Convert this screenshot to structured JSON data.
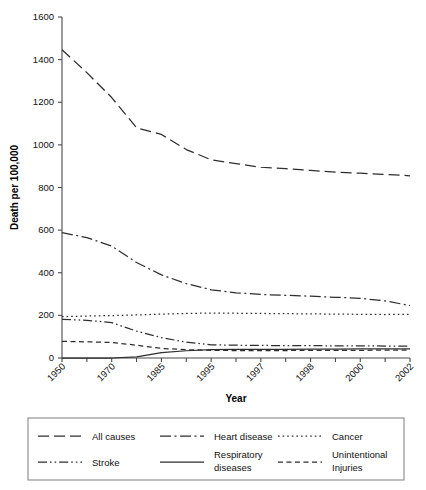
{
  "chart_data": {
    "type": "line",
    "title": "",
    "xlabel": "Year",
    "ylabel": "Death per 100,000",
    "ylim": [
      0,
      1600
    ],
    "ytick_values": [
      0,
      200,
      400,
      600,
      800,
      1000,
      1200,
      1400,
      1600
    ],
    "ytick_labels": [
      "0",
      "200",
      "400",
      "600",
      "800",
      "1000",
      "1200",
      "1400",
      "1600"
    ],
    "grid": false,
    "legend_position": "below-axes",
    "x_index_count": 15,
    "x_labeled_indices": [
      0,
      2,
      4,
      6,
      8,
      10,
      12,
      14
    ],
    "categories": [
      "1950",
      "1960",
      "1970",
      "1980",
      "1985",
      "1990",
      "1995",
      "1996",
      "1997",
      "1997.5",
      "1998",
      "1999",
      "2000",
      "2001",
      "2002"
    ],
    "xtick_labels": [
      "1950",
      "1970",
      "1985",
      "1995",
      "1997",
      "1998",
      "2000",
      "2002"
    ],
    "series": [
      {
        "name": "All causes",
        "line_style": "long-dash",
        "dash_pattern": "11,5",
        "values": [
          1446,
          1339,
          1222,
          1080,
          1049,
          978,
          930,
          912,
          895,
          888,
          880,
          872,
          867,
          861,
          855
        ]
      },
      {
        "name": "Heart disease",
        "line_style": "dash-dot",
        "dash_pattern": "11,3.5,2,3.5",
        "values": [
          588,
          565,
          525,
          448,
          390,
          349,
          320,
          306,
          298,
          294,
          290,
          285,
          280,
          268,
          246
        ]
      },
      {
        "name": "Cancer",
        "line_style": "dotted",
        "dash_pattern": "1.6,3",
        "values": [
          194,
          197,
          199,
          202,
          206,
          209,
          211,
          210,
          209,
          208,
          207,
          206,
          205,
          204,
          205
        ]
      },
      {
        "name": "Stroke",
        "line_style": "dash-dot-dot",
        "dash_pattern": "9,3,1.6,3,1.6,3",
        "values": [
          181,
          177,
          166,
          126,
          96,
          74,
          62,
          60,
          59,
          58,
          58,
          57,
          57,
          56,
          56
        ]
      },
      {
        "name": "Respiratory diseases",
        "line_style": "solid",
        "dash_pattern": "none",
        "values": [
          0,
          0,
          0,
          5,
          25,
          34,
          39,
          40,
          41,
          41,
          42,
          42,
          43,
          43,
          43
        ]
      },
      {
        "name": "Unintentional Injuries",
        "line_style": "dashed",
        "dash_pattern": "5,3.5",
        "values": [
          78,
          76,
          73,
          60,
          45,
          39,
          36,
          35,
          35,
          35,
          36,
          36,
          36,
          37,
          37
        ]
      }
    ]
  },
  "legend": {
    "entries": [
      {
        "label": "All causes",
        "style": "long-dash"
      },
      {
        "label": "Heart disease",
        "style": "dash-dot"
      },
      {
        "label": "Cancer",
        "style": "dotted"
      },
      {
        "label": "Stroke",
        "style": "dash-dot-dot"
      },
      {
        "label": "Respiratory diseases",
        "style": "solid"
      },
      {
        "label": "Unintentional Injuries",
        "style": "dashed"
      }
    ]
  }
}
